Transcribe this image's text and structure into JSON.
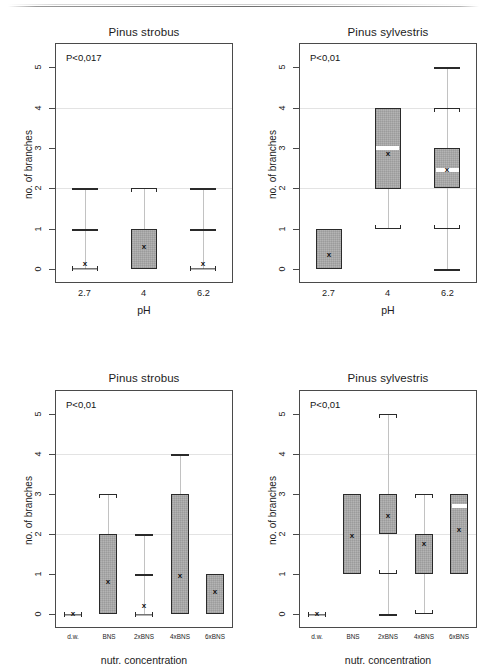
{
  "figure": {
    "y_axis_title": "no. of branches",
    "y_ticks": [
      "0",
      "1",
      "2",
      "3",
      "4",
      "5"
    ],
    "y_range": [
      -0.35,
      5.6
    ],
    "gridline_values": [
      2,
      4
    ],
    "mean_marker": "x"
  },
  "chart_data": [
    {
      "type": "box",
      "panel_id": "panel-top-left",
      "title": "Pinus strobus",
      "annotation": "P<0,017",
      "xlabel": "pH",
      "ylabel": "no. of branches",
      "ylim": [
        0,
        5.6
      ],
      "yticks": [
        0,
        1,
        2,
        3,
        4,
        5
      ],
      "grid": true,
      "categories": [
        "2.7",
        "4",
        "6.2"
      ],
      "boxes": [
        {
          "category": "2.7",
          "q1": 0,
          "q3": 0,
          "median": 0,
          "mean": 0.12,
          "whisker_low": 0,
          "whisker_high": 0,
          "outlier_marks": [
            1,
            2
          ],
          "style": "hbar"
        },
        {
          "category": "4",
          "q1": 0,
          "q3": 1,
          "median": 0,
          "mean": 0.55,
          "whisker_low": 0,
          "whisker_high": 2,
          "outlier_marks": [],
          "style": "box"
        },
        {
          "category": "6.2",
          "q1": 0,
          "q3": 0,
          "median": 0,
          "mean": 0.12,
          "whisker_low": 0,
          "whisker_high": 0,
          "outlier_marks": [
            1,
            2
          ],
          "style": "hbar"
        }
      ]
    },
    {
      "type": "box",
      "panel_id": "panel-top-right",
      "title": "Pinus sylvestris",
      "annotation": "P<0,01",
      "xlabel": "pH",
      "ylabel": "no. of branches",
      "ylim": [
        0,
        5.6
      ],
      "yticks": [
        0,
        1,
        2,
        3,
        4,
        5
      ],
      "grid": true,
      "categories": [
        "2.7",
        "4",
        "6.2"
      ],
      "boxes": [
        {
          "category": "2.7",
          "q1": 0,
          "q3": 1,
          "median": 0,
          "mean": 0.35,
          "whisker_low": 0,
          "whisker_high": 1,
          "outlier_marks": [],
          "style": "box"
        },
        {
          "category": "4",
          "q1": 2,
          "q3": 4,
          "median": 3,
          "mean": 2.85,
          "whisker_low": 1,
          "whisker_high": 4,
          "outlier_marks": [],
          "style": "box"
        },
        {
          "category": "6.2",
          "q1": 2,
          "q3": 3,
          "median": 2.45,
          "mean": 2.45,
          "whisker_low": 1,
          "whisker_high": 4,
          "outlier_marks": [
            0,
            5
          ],
          "style": "box"
        }
      ]
    },
    {
      "type": "box",
      "panel_id": "panel-bottom-left",
      "title": "Pinus strobus",
      "annotation": "P<0,01",
      "xlabel": "nutr. concentration",
      "ylabel": "no. of branches",
      "ylim": [
        0,
        5.6
      ],
      "yticks": [
        0,
        1,
        2,
        3,
        4,
        5
      ],
      "grid": true,
      "categories": [
        "d.w.",
        "BNS",
        "2xBNS",
        "4xBNS",
        "6xBNS"
      ],
      "boxes": [
        {
          "category": "d.w.",
          "q1": 0,
          "q3": 0,
          "median": 0,
          "mean": 0.0,
          "whisker_low": 0,
          "whisker_high": 0,
          "outlier_marks": [],
          "style": "hbar"
        },
        {
          "category": "BNS",
          "q1": 0,
          "q3": 2,
          "median": 0,
          "mean": 0.8,
          "whisker_low": 0,
          "whisker_high": 3,
          "outlier_marks": [],
          "style": "box"
        },
        {
          "category": "2xBNS",
          "q1": 0,
          "q3": 0,
          "median": 0,
          "mean": 0.2,
          "whisker_low": 0,
          "whisker_high": 0,
          "outlier_marks": [
            1,
            2
          ],
          "style": "hbar"
        },
        {
          "category": "4xBNS",
          "q1": 0,
          "q3": 3,
          "median": 0,
          "mean": 0.95,
          "whisker_low": 0,
          "whisker_high": 3,
          "outlier_marks": [
            4
          ],
          "style": "box"
        },
        {
          "category": "6xBNS",
          "q1": 0,
          "q3": 1,
          "median": 0,
          "mean": 0.55,
          "whisker_low": 0,
          "whisker_high": 1,
          "outlier_marks": [],
          "style": "box"
        }
      ]
    },
    {
      "type": "box",
      "panel_id": "panel-bottom-right",
      "title": "Pinus sylvestris",
      "annotation": "P<0,01",
      "xlabel": "nutr. concentration",
      "ylabel": "no. of branches",
      "ylim": [
        0,
        5.6
      ],
      "yticks": [
        0,
        1,
        2,
        3,
        4,
        5
      ],
      "grid": true,
      "categories": [
        "d.w.",
        "BNS",
        "2xBNS",
        "4xBNS",
        "6xBNS"
      ],
      "boxes": [
        {
          "category": "d.w.",
          "q1": 0,
          "q3": 0,
          "median": 0,
          "mean": 0.0,
          "whisker_low": 0,
          "whisker_high": 0,
          "outlier_marks": [],
          "style": "hbar"
        },
        {
          "category": "BNS",
          "q1": 1,
          "q3": 3,
          "median": 1,
          "mean": 1.95,
          "whisker_low": 1,
          "whisker_high": 3,
          "outlier_marks": [],
          "style": "box"
        },
        {
          "category": "2xBNS",
          "q1": 2,
          "q3": 3,
          "median": 2,
          "mean": 2.45,
          "whisker_low": 1,
          "whisker_high": 5,
          "outlier_marks": [
            0
          ],
          "style": "box"
        },
        {
          "category": "4xBNS",
          "q1": 1,
          "q3": 2,
          "median": 1,
          "mean": 1.75,
          "whisker_low": 0,
          "whisker_high": 3,
          "outlier_marks": [],
          "style": "box"
        },
        {
          "category": "6xBNS",
          "q1": 1,
          "q3": 3,
          "median": 2.7,
          "mean": 2.1,
          "whisker_low": 1,
          "whisker_high": 3,
          "outlier_marks": [],
          "style": "box"
        }
      ]
    }
  ]
}
